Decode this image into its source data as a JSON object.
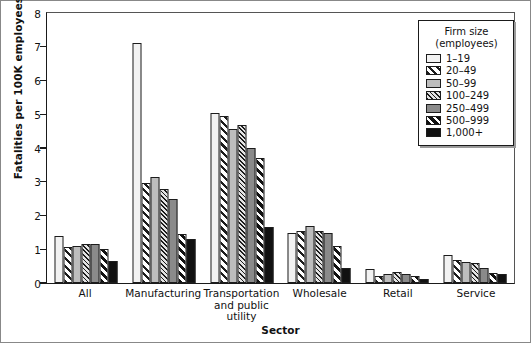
{
  "chart_data": {
    "type": "bar",
    "title": "",
    "xlabel": "Sector",
    "ylabel": "Fatalities per 100K employees",
    "ylim": [
      0,
      8
    ],
    "yticks": [
      "0",
      "1",
      "2",
      "3",
      "4",
      "5",
      "6",
      "7",
      "8"
    ],
    "grid": false,
    "legend_position": "top-right",
    "legend_title_line1": "Firm size",
    "legend_title_line2": "(employees)",
    "categories": [
      {
        "lines": [
          "All"
        ]
      },
      {
        "lines": [
          "Manufacturing"
        ]
      },
      {
        "lines": [
          "Transportation",
          "and public",
          "utility"
        ]
      },
      {
        "lines": [
          "Wholesale"
        ]
      },
      {
        "lines": [
          "Retail"
        ]
      },
      {
        "lines": [
          "Service"
        ]
      }
    ],
    "series": [
      {
        "name": "1–19",
        "pattern": "solid-white",
        "color": "#f2f2f2",
        "values": [
          1.38,
          7.1,
          5.05,
          1.48,
          0.42,
          0.82
        ]
      },
      {
        "name": "20–49",
        "pattern": "wide-diagonal",
        "color": "#ffffff",
        "values": [
          1.08,
          2.95,
          4.95,
          1.55,
          0.22,
          0.68
        ]
      },
      {
        "name": "50–99",
        "pattern": "solid-light-gray",
        "color": "#bdbdbd",
        "values": [
          1.1,
          3.15,
          4.55,
          1.68,
          0.28,
          0.62
        ]
      },
      {
        "name": "100–249",
        "pattern": "fine-diagonal",
        "color": "#e3e3e3",
        "values": [
          1.15,
          2.78,
          4.68,
          1.55,
          0.32,
          0.58
        ]
      },
      {
        "name": "250–499",
        "pattern": "solid-medium-gray",
        "color": "#8a8a8a",
        "values": [
          1.15,
          2.5,
          4.0,
          1.48,
          0.28,
          0.45
        ]
      },
      {
        "name": "500–999",
        "pattern": "bold-diagonal",
        "color": "#ffffff",
        "values": [
          1.0,
          1.45,
          3.7,
          1.1,
          0.2,
          0.3
        ]
      },
      {
        "name": "1,000+",
        "pattern": "solid-black",
        "color": "#111111",
        "values": [
          0.64,
          1.3,
          1.65,
          0.45,
          0.12,
          0.28
        ]
      }
    ]
  }
}
